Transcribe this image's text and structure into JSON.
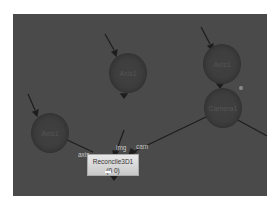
{
  "graph": {
    "background": "#4a4a4a",
    "nodes": [
      {
        "id": "axis-left",
        "label": "Axis1"
      },
      {
        "id": "axis-middle",
        "label": "Axis1"
      },
      {
        "id": "axis-top-right",
        "label": "Axis1"
      },
      {
        "id": "camera",
        "label": "Camera1"
      }
    ],
    "reconcile": {
      "title": "Reconcile3D1",
      "subtitle": "(0 0)"
    },
    "inputs": {
      "axis": "axis",
      "img": "img",
      "cam": "cam"
    }
  }
}
